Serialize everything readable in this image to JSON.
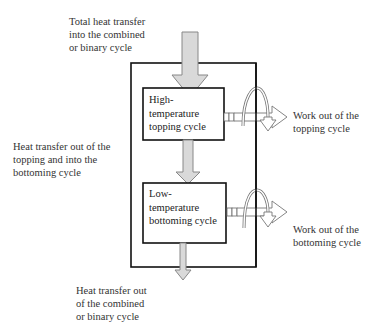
{
  "diagram": {
    "type": "flow",
    "colors": {
      "arrow_fill": "#d9d9d9",
      "arrow_stroke": "#888888",
      "box_stroke": "#111111",
      "text": "#333333"
    },
    "labels": {
      "heat_in": "Total heat transfer\ninto the combined\nor binary cycle",
      "heat_between": "Heat transfer out of the\ntopping and into the\nbottoming cycle",
      "heat_out": "Heat transfer out\nof the combined\nor binary cycle",
      "work_topping": "Work out of the\ntopping cycle",
      "work_bottoming": "Work out of the\nbottoming cycle"
    },
    "boxes": {
      "outer": "Combined or binary cycle",
      "topping": "High-\ntemperature\ntopping cycle",
      "bottoming": "Low-\ntemperature\nbottoming cycle"
    },
    "nodes": [
      {
        "id": "topping",
        "label": "High-temperature topping cycle"
      },
      {
        "id": "bottoming",
        "label": "Low-temperature bottoming cycle"
      }
    ],
    "edges": [
      {
        "from": "source",
        "to": "topping",
        "label": "Total heat transfer into the combined or binary cycle"
      },
      {
        "from": "topping",
        "to": "bottoming",
        "label": "Heat transfer out of the topping and into the bottoming cycle"
      },
      {
        "from": "bottoming",
        "to": "sink",
        "label": "Heat transfer out of the combined or binary cycle"
      },
      {
        "from": "topping",
        "to": "work",
        "label": "Work out of the topping cycle"
      },
      {
        "from": "bottoming",
        "to": "work",
        "label": "Work out of the bottoming cycle"
      }
    ]
  }
}
